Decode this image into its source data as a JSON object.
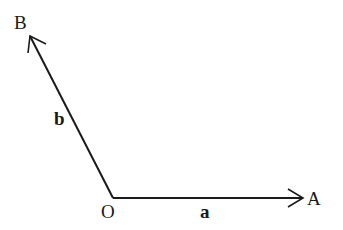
{
  "diagram": {
    "type": "vector-diagram",
    "points": {
      "origin": {
        "label": "O",
        "x": 113,
        "y": 198
      },
      "A": {
        "label": "A",
        "x": 303,
        "y": 198
      },
      "B": {
        "label": "B",
        "x": 30,
        "y": 36
      }
    },
    "vectors": [
      {
        "name": "a",
        "label": "a",
        "from": "O",
        "to": "A"
      },
      {
        "name": "b",
        "label": "b",
        "from": "O",
        "to": "B"
      }
    ],
    "colors": {
      "stroke": "#1a1a1a",
      "background": "#ffffff"
    }
  }
}
